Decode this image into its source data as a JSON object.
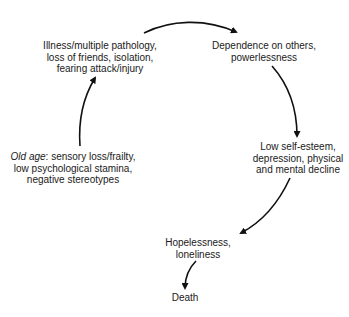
{
  "diagram": {
    "type": "cycle",
    "colors": {
      "text": "#1a1a1a",
      "arrow": "#111111",
      "background": "#ffffff"
    },
    "nodes": {
      "illness": {
        "lines": [
          "Illness/multiple pathology,",
          "loss of friends, isolation,",
          "fearing attack/injury"
        ]
      },
      "dependence": {
        "lines": [
          "Dependence on others,",
          "powerlessness"
        ]
      },
      "self_esteem": {
        "lines": [
          "Low self-esteem,",
          "depression, physical",
          "and mental decline"
        ]
      },
      "hopelessness": {
        "lines": [
          "Hopelessness,",
          "loneliness"
        ]
      },
      "death": {
        "lines": [
          "Death"
        ]
      },
      "old_age": {
        "label_italic": "Old age",
        "label_rest": ": sensory loss/frailty,",
        "lines": [
          "low psychological stamina,",
          "negative stereotypes"
        ]
      }
    },
    "edges": [
      {
        "from": "old_age",
        "to": "illness"
      },
      {
        "from": "illness",
        "to": "dependence"
      },
      {
        "from": "dependence",
        "to": "self_esteem"
      },
      {
        "from": "self_esteem",
        "to": "hopelessness"
      },
      {
        "from": "hopelessness",
        "to": "death"
      }
    ]
  }
}
